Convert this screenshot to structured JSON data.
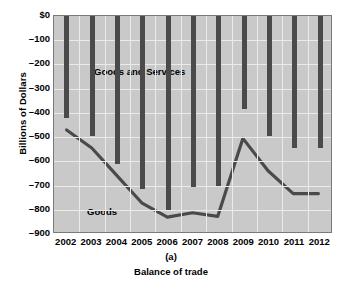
{
  "chart_data": {
    "type": "bar",
    "title": "",
    "caption": "Balance of trade",
    "panel_label": "(a)",
    "xlabel": "",
    "ylabel": "Billions of Dollars",
    "categories": [
      "2002",
      "2003",
      "2004",
      "2005",
      "2006",
      "2007",
      "2008",
      "2009",
      "2010",
      "2011",
      "2012"
    ],
    "ylim": [
      -900,
      0
    ],
    "ytick_labels": [
      "$0",
      "–100",
      "–200",
      "–300",
      "–400",
      "–500",
      "–600",
      "–700",
      "–800",
      "–900"
    ],
    "ytick_values": [
      0,
      -100,
      -200,
      -300,
      -400,
      -500,
      -600,
      -700,
      -800,
      -900
    ],
    "grid": true,
    "legend_position": "inline-annotations",
    "series": [
      {
        "name": "Goods and Services",
        "render": "bar",
        "color": "#4a4a4a",
        "values": [
          -420,
          -495,
          -610,
          -715,
          -800,
          -705,
          -700,
          -385,
          -495,
          -545,
          -545
        ]
      },
      {
        "name": "Goods",
        "render": "line",
        "color": "#4a4a4a",
        "values": [
          -475,
          -550,
          -665,
          -780,
          -838,
          -820,
          -835,
          -510,
          -645,
          -740,
          -740
        ]
      }
    ],
    "annotations": [
      {
        "text": "Goods and Services",
        "series": "Goods and Services"
      },
      {
        "text": "Goods",
        "series": "Goods"
      }
    ]
  },
  "figure": {
    "axis_title_y": "Billions of Dollars",
    "panel_id": "(a)",
    "caption": "Balance of trade"
  }
}
